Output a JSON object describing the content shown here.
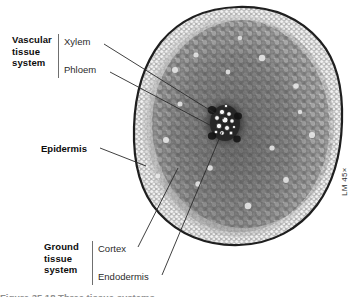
{
  "figure": {
    "kind": "light-micrograph-cross-section",
    "magnification_label": "LM 45×",
    "caption_partial": "Figure 35.18  Three tissue systems",
    "background_color": "#ffffff",
    "leader_line_color": "#2a2a2a",
    "label_text_color": "#0d0d0d",
    "sub_label_text_color": "#2b2b2b"
  },
  "micrograph": {
    "name": "root-cross-section",
    "center_x": 238,
    "center_y": 126,
    "radius_x": 104,
    "radius_y": 119,
    "stele_center_x": 225,
    "stele_center_y": 123
  },
  "label_groups": [
    {
      "id": "vascular",
      "title_lines": [
        "Vascular",
        "tissue",
        "system"
      ],
      "title_x": 12,
      "title_y": 34,
      "bar_x": 58,
      "bar_y": 34,
      "bar_height": 44,
      "sub_labels": [
        {
          "id": "xylem",
          "text": "Xylem",
          "x": 64,
          "y": 36
        },
        {
          "id": "phloem",
          "text": "Phloem",
          "x": 64,
          "y": 64
        }
      ]
    },
    {
      "id": "ground",
      "title_lines": [
        "Ground",
        "tissue",
        "system"
      ],
      "title_x": 44,
      "title_y": 241,
      "bar_x": 92,
      "bar_y": 241,
      "bar_height": 44,
      "sub_labels": [
        {
          "id": "cortex",
          "text": "Cortex",
          "x": 98,
          "y": 243
        },
        {
          "id": "endodermis",
          "text": "Endodermis",
          "x": 98,
          "y": 271
        }
      ]
    }
  ],
  "solo_labels": [
    {
      "id": "epidermis",
      "text": "Epidermis",
      "x": 41,
      "y": 143
    }
  ],
  "leaders": [
    {
      "id": "xylem-leader",
      "x1": 104,
      "y1": 44,
      "x2": 224,
      "y2": 119
    },
    {
      "id": "phloem-leader",
      "x1": 110,
      "y1": 72,
      "x2": 221,
      "y2": 131
    },
    {
      "id": "epidermis-leader",
      "x1": 100,
      "y1": 148,
      "x2": 146,
      "y2": 166
    },
    {
      "id": "cortex-leader",
      "x1": 138,
      "y1": 247,
      "x2": 178,
      "y2": 168
    },
    {
      "id": "endodermis-leader",
      "x1": 162,
      "y1": 275,
      "x2": 222,
      "y2": 132
    }
  ],
  "magnification": {
    "text": "LM 45×",
    "x": 340,
    "y": 196
  }
}
